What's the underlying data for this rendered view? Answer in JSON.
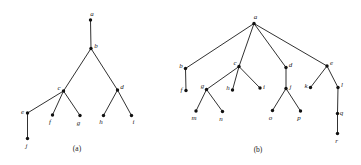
{
  "figure": {
    "background": "#ffffff",
    "stroke_color": "#1a1a1a",
    "node_color": "#111111",
    "node_radius": 1.7,
    "edge_width": 0.9,
    "width": 361,
    "height": 165
  },
  "panels": [
    {
      "id": "a",
      "caption": "(a)",
      "caption_pos": {
        "x": 77,
        "y": 148
      },
      "nodes": [
        {
          "id": "a",
          "label": "a",
          "x": 90.5,
          "y": 20.0,
          "label_dx": 1.5,
          "label_dy": -6.5
        },
        {
          "id": "b",
          "label": "b",
          "x": 91.0,
          "y": 48.5,
          "label_dx": 5.0,
          "label_dy": -2.5
        },
        {
          "id": "c",
          "label": "c",
          "x": 63.5,
          "y": 91.0,
          "label_dx": -4.5,
          "label_dy": -3.5
        },
        {
          "id": "d",
          "label": "d",
          "x": 117.5,
          "y": 90.0,
          "label_dx": 4.5,
          "label_dy": -3.5
        },
        {
          "id": "e",
          "label": "e",
          "x": 27.5,
          "y": 113.0,
          "label_dx": -5.0,
          "label_dy": -1.5
        },
        {
          "id": "f",
          "label": "f",
          "x": 52.5,
          "y": 115.0,
          "label_dx": -2.5,
          "label_dy": 6.5
        },
        {
          "id": "g",
          "label": "g",
          "x": 80.0,
          "y": 115.5,
          "label_dx": -1.5,
          "label_dy": 7.0
        },
        {
          "id": "h",
          "label": "h",
          "x": 103.5,
          "y": 115.5,
          "label_dx": -2.5,
          "label_dy": 6.5
        },
        {
          "id": "i",
          "label": "i",
          "x": 131.5,
          "y": 115.5,
          "label_dx": 2.0,
          "label_dy": 6.5
        },
        {
          "id": "j",
          "label": "j",
          "x": 27.5,
          "y": 138.5,
          "label_dx": -1.0,
          "label_dy": 7.0
        }
      ],
      "edges": [
        [
          "a",
          "b"
        ],
        [
          "b",
          "c"
        ],
        [
          "b",
          "d"
        ],
        [
          "c",
          "e"
        ],
        [
          "c",
          "f"
        ],
        [
          "c",
          "g"
        ],
        [
          "d",
          "h"
        ],
        [
          "d",
          "i"
        ],
        [
          "e",
          "j"
        ]
      ]
    },
    {
      "id": "b",
      "caption": "(b)",
      "caption_pos": {
        "x": 258,
        "y": 149
      },
      "nodes": [
        {
          "id": "a",
          "label": "a",
          "x": 254.0,
          "y": 23.5,
          "label_dx": 1.5,
          "label_dy": -6.5
        },
        {
          "id": "b",
          "label": "b",
          "x": 185.5,
          "y": 68.5,
          "label_dx": -4.5,
          "label_dy": -3.0
        },
        {
          "id": "c",
          "label": "c",
          "x": 239.0,
          "y": 66.5,
          "label_dx": -4.0,
          "label_dy": -3.5
        },
        {
          "id": "d",
          "label": "d",
          "x": 286.0,
          "y": 67.5,
          "label_dx": 4.5,
          "label_dy": -3.0
        },
        {
          "id": "e",
          "label": "e",
          "x": 327.0,
          "y": 66.0,
          "label_dx": 4.5,
          "label_dy": -3.0
        },
        {
          "id": "f",
          "label": "f",
          "x": 186.0,
          "y": 90.5,
          "label_dx": -4.5,
          "label_dy": -1.0
        },
        {
          "id": "g",
          "label": "g",
          "x": 206.5,
          "y": 89.5,
          "label_dx": -4.0,
          "label_dy": -3.5
        },
        {
          "id": "h",
          "label": "h",
          "x": 232.5,
          "y": 90.0,
          "label_dx": -4.5,
          "label_dy": -2.5
        },
        {
          "id": "i",
          "label": "i",
          "x": 260.0,
          "y": 88.0,
          "label_dx": 4.0,
          "label_dy": -1.0
        },
        {
          "id": "j",
          "label": "j",
          "x": 286.0,
          "y": 88.5,
          "label_dx": 4.5,
          "label_dy": -2.0
        },
        {
          "id": "k",
          "label": "k",
          "x": 310.5,
          "y": 87.5,
          "label_dx": -4.5,
          "label_dy": -1.5
        },
        {
          "id": "l",
          "label": "l",
          "x": 338.0,
          "y": 87.5,
          "label_dx": 4.0,
          "label_dy": -2.5
        },
        {
          "id": "m",
          "label": "m",
          "x": 196.0,
          "y": 111.0,
          "label_dx": -2.0,
          "label_dy": 7.0
        },
        {
          "id": "n",
          "label": "n",
          "x": 222.5,
          "y": 111.5,
          "label_dx": -1.5,
          "label_dy": 7.0
        },
        {
          "id": "o",
          "label": "o",
          "x": 272.5,
          "y": 110.5,
          "label_dx": -2.0,
          "label_dy": 7.0
        },
        {
          "id": "p",
          "label": "p",
          "x": 300.5,
          "y": 111.0,
          "label_dx": -1.5,
          "label_dy": 7.0
        },
        {
          "id": "q",
          "label": "q",
          "x": 337.5,
          "y": 113.5,
          "label_dx": 4.0,
          "label_dy": -0.5
        },
        {
          "id": "r",
          "label": "r",
          "x": 337.5,
          "y": 133.5,
          "label_dx": -1.0,
          "label_dy": 7.0
        }
      ],
      "edges": [
        [
          "a",
          "b"
        ],
        [
          "a",
          "c"
        ],
        [
          "a",
          "d"
        ],
        [
          "a",
          "e"
        ],
        [
          "b",
          "f"
        ],
        [
          "c",
          "g"
        ],
        [
          "c",
          "h"
        ],
        [
          "c",
          "i"
        ],
        [
          "d",
          "j"
        ],
        [
          "e",
          "k"
        ],
        [
          "e",
          "l"
        ],
        [
          "g",
          "m"
        ],
        [
          "g",
          "n"
        ],
        [
          "j",
          "o"
        ],
        [
          "j",
          "p"
        ],
        [
          "l",
          "q"
        ],
        [
          "q",
          "r"
        ]
      ]
    }
  ]
}
